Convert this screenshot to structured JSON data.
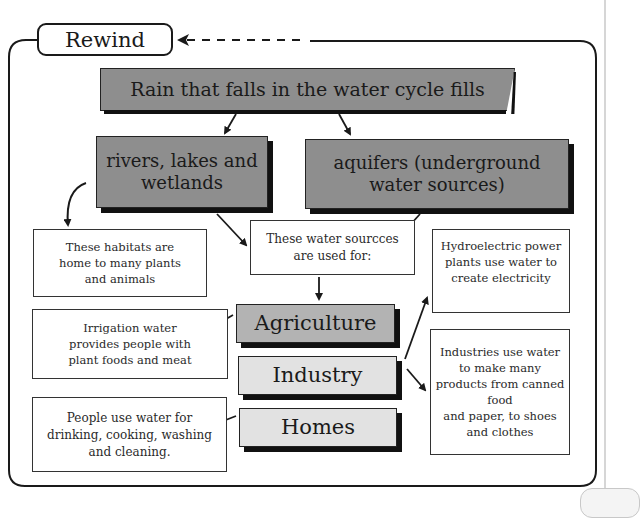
{
  "title": "Rewind",
  "diagram": {
    "top": "Rain that falls in the water cycle fills",
    "sources": [
      {
        "id": "surface",
        "label": "rivers, lakes and\nwetlands"
      },
      {
        "id": "ground",
        "label": "aquifers (underground\nwater sources)"
      }
    ],
    "habitat_note": "These habitats are\nhome to many plants\nand animals",
    "uses_intro": "These water sourcces\nare used for:",
    "uses": [
      {
        "id": "agriculture",
        "label": "Agriculture",
        "note": "Irrigation water\nprovides people with\nplant foods and meat"
      },
      {
        "id": "industry",
        "label": "Industry",
        "notes": [
          "Hydroelectric power\nplants use water to\ncreate electricity",
          "Industries use water\nto make many\nproducts from canned\nfood\nand paper, to shoes\nand clothes"
        ]
      },
      {
        "id": "homes",
        "label": "Homes",
        "note": "People use water for\ndrinking, cooking, washing\nand cleaning."
      }
    ]
  },
  "colors": {
    "dark_box": "#8e8e8e",
    "agriculture_box": "#b3b3b3",
    "light_box": "#e2e2e2",
    "stroke": "#1a1a1a"
  }
}
